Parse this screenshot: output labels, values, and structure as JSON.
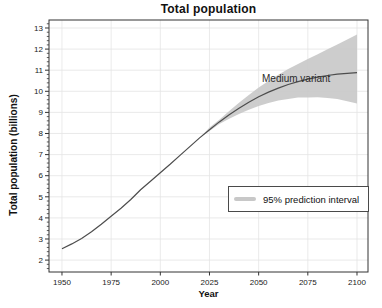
{
  "colors": {
    "line": "#4d4d4d",
    "interval": "#c8c8c8",
    "grid": "#e4e4e4",
    "axis": "#333333",
    "text": "#1a1a1a",
    "background": "#ffffff"
  },
  "chart_data": {
    "type": "line",
    "title": "Total population",
    "xlabel": "Year",
    "ylabel": "Total population (billions)",
    "xlim": [
      1943.4,
      2105.6
    ],
    "ylim": [
      1.436,
      13.379
    ],
    "x_ticks": [
      1950,
      1975,
      2000,
      2025,
      2050,
      2075,
      2100
    ],
    "y_ticks": [
      2,
      3,
      4,
      5,
      6,
      7,
      8,
      9,
      10,
      11,
      12,
      13
    ],
    "grid": true,
    "annotation": "Medium variant",
    "legend": {
      "label": "95% prediction interval",
      "position": "right-center"
    },
    "series": [
      {
        "name": "Medium variant",
        "x": [
          1950,
          1955,
          1960,
          1965,
          1970,
          1975,
          1980,
          1985,
          1990,
          1995,
          2000,
          2005,
          2010,
          2015,
          2020,
          2025,
          2030,
          2035,
          2040,
          2045,
          2050,
          2055,
          2060,
          2065,
          2070,
          2075,
          2080,
          2085,
          2090,
          2095,
          2100
        ],
        "y": [
          2.54,
          2.77,
          3.03,
          3.34,
          3.7,
          4.08,
          4.46,
          4.87,
          5.33,
          5.74,
          6.14,
          6.54,
          6.96,
          7.38,
          7.79,
          8.18,
          8.55,
          8.89,
          9.2,
          9.48,
          9.74,
          9.96,
          10.15,
          10.32,
          10.46,
          10.58,
          10.67,
          10.75,
          10.81,
          10.85,
          10.88
        ]
      }
    ],
    "interval": {
      "name": "95% prediction interval",
      "x": [
        2020,
        2025,
        2030,
        2035,
        2040,
        2045,
        2050,
        2055,
        2060,
        2065,
        2070,
        2075,
        2080,
        2085,
        2090,
        2095,
        2100
      ],
      "lower": [
        7.79,
        8.12,
        8.45,
        8.7,
        8.93,
        9.13,
        9.31,
        9.45,
        9.57,
        9.64,
        9.7,
        9.71,
        9.72,
        9.68,
        9.63,
        9.53,
        9.42
      ],
      "upper": [
        7.79,
        8.28,
        8.65,
        9.06,
        9.46,
        9.83,
        10.18,
        10.49,
        10.78,
        11.05,
        11.29,
        11.53,
        11.76,
        11.99,
        12.22,
        12.45,
        12.69
      ]
    }
  }
}
